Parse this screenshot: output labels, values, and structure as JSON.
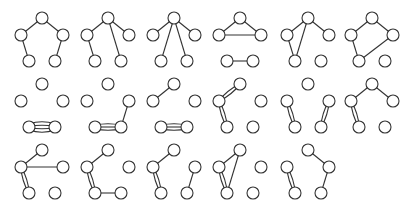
{
  "diagram": {
    "title": "",
    "colors": {
      "edge": "#333333",
      "node_fill": "#ffffff",
      "node_stroke": "#333333",
      "background": "#ffffff"
    },
    "node_radius": 6,
    "layout": {
      "vertex_positions": {
        "T": [
          42,
          18
        ],
        "L": [
          21,
          35
        ],
        "R": [
          63,
          35
        ],
        "A": [
          29,
          61
        ],
        "B": [
          55,
          61
        ]
      },
      "column_offsets": [
        0,
        66,
        132,
        198,
        266,
        330
      ],
      "row_offsets": [
        0,
        66,
        132
      ]
    },
    "graphs": [
      {
        "id": 1,
        "row": 0,
        "col": 0,
        "edges": [
          [
            "T",
            "L",
            1
          ],
          [
            "T",
            "R",
            1
          ],
          [
            "L",
            "A",
            1
          ],
          [
            "R",
            "B",
            1
          ]
        ]
      },
      {
        "id": 2,
        "row": 0,
        "col": 1,
        "edges": [
          [
            "T",
            "L",
            1
          ],
          [
            "T",
            "R",
            1
          ],
          [
            "L",
            "A",
            1
          ],
          [
            "T",
            "B",
            1
          ]
        ]
      },
      {
        "id": 3,
        "row": 0,
        "col": 2,
        "edges": [
          [
            "T",
            "L",
            1
          ],
          [
            "T",
            "R",
            1
          ],
          [
            "T",
            "A",
            1
          ],
          [
            "T",
            "B",
            1
          ]
        ]
      },
      {
        "id": 4,
        "row": 0,
        "col": 3,
        "edges": [
          [
            "T",
            "L",
            1
          ],
          [
            "T",
            "R",
            1
          ],
          [
            "L",
            "R",
            1
          ],
          [
            "A",
            "B",
            1
          ]
        ]
      },
      {
        "id": 5,
        "row": 0,
        "col": 4,
        "edges": [
          [
            "T",
            "L",
            1
          ],
          [
            "T",
            "R",
            1
          ],
          [
            "L",
            "A",
            1
          ],
          [
            "T",
            "A",
            1
          ]
        ]
      },
      {
        "id": 6,
        "row": 0,
        "col": 5,
        "edges": [
          [
            "T",
            "L",
            1
          ],
          [
            "T",
            "R",
            1
          ],
          [
            "L",
            "A",
            1
          ],
          [
            "R",
            "A",
            1
          ]
        ]
      },
      {
        "id": 7,
        "row": 1,
        "col": 0,
        "edges": [
          [
            "A",
            "B",
            4
          ]
        ]
      },
      {
        "id": 8,
        "row": 1,
        "col": 1,
        "edges": [
          [
            "A",
            "B",
            3
          ],
          [
            "R",
            "B",
            1
          ]
        ]
      },
      {
        "id": 9,
        "row": 1,
        "col": 2,
        "edges": [
          [
            "L",
            "T",
            1
          ],
          [
            "A",
            "B",
            3
          ]
        ]
      },
      {
        "id": 10,
        "row": 1,
        "col": 3,
        "edges": [
          [
            "T",
            "L",
            2
          ],
          [
            "L",
            "A",
            2
          ]
        ]
      },
      {
        "id": 11,
        "row": 1,
        "col": 4,
        "edges": [
          [
            "L",
            "A",
            2
          ],
          [
            "R",
            "B",
            2
          ]
        ]
      },
      {
        "id": 12,
        "row": 1,
        "col": 5,
        "edges": [
          [
            "T",
            "L",
            1
          ],
          [
            "T",
            "R",
            1
          ],
          [
            "L",
            "A",
            2
          ]
        ]
      },
      {
        "id": 13,
        "row": 2,
        "col": 0,
        "edges": [
          [
            "L",
            "T",
            1
          ],
          [
            "L",
            "R",
            1
          ],
          [
            "L",
            "A",
            2
          ]
        ]
      },
      {
        "id": 14,
        "row": 2,
        "col": 1,
        "edges": [
          [
            "L",
            "T",
            1
          ],
          [
            "L",
            "A",
            2
          ],
          [
            "A",
            "B",
            1
          ]
        ]
      },
      {
        "id": 15,
        "row": 2,
        "col": 2,
        "edges": [
          [
            "L",
            "T",
            1
          ],
          [
            "L",
            "A",
            2
          ],
          [
            "R",
            "B",
            1
          ]
        ]
      },
      {
        "id": 16,
        "row": 2,
        "col": 3,
        "edges": [
          [
            "L",
            "T",
            1
          ],
          [
            "L",
            "A",
            2
          ],
          [
            "T",
            "A",
            1
          ]
        ]
      },
      {
        "id": 17,
        "row": 2,
        "col": 4,
        "edges": [
          [
            "L",
            "A",
            2
          ],
          [
            "T",
            "R",
            1
          ],
          [
            "R",
            "B",
            1
          ]
        ]
      }
    ]
  }
}
